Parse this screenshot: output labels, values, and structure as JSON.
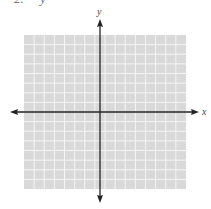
{
  "header_fragment": "2.     y",
  "diagram": {
    "type": "coordinate-plane",
    "x_axis_label": "x",
    "y_axis_label": "y",
    "grid_columns": 16,
    "grid_rows": 16,
    "colors": {
      "grid_fill": "#d9d9d9",
      "grid_lines": "#f5f5f5",
      "axis": "#222222"
    }
  }
}
